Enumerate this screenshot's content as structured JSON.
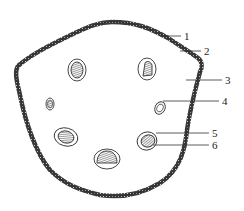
{
  "diagram": {
    "type": "cross-section",
    "colors": {
      "outline": "#2a2a2a",
      "background": "#ffffff",
      "hatch": "#3a3a3a"
    },
    "labels": [
      {
        "id": "1",
        "text": "1",
        "x": 185,
        "y": 39,
        "line": [
          160,
          36,
          181,
          36
        ]
      },
      {
        "id": "2",
        "text": "2",
        "x": 205,
        "y": 54,
        "line": [
          180,
          51,
          201,
          51
        ]
      },
      {
        "id": "3",
        "text": "3",
        "x": 226,
        "y": 84,
        "line": [
          186,
          80,
          222,
          80
        ]
      },
      {
        "id": "4",
        "text": "4",
        "x": 223,
        "y": 104,
        "line": [
          163,
          101,
          219,
          101
        ]
      },
      {
        "id": "5",
        "text": "5",
        "x": 213,
        "y": 137,
        "line": [
          156,
          133,
          209,
          133
        ]
      },
      {
        "id": "6",
        "text": "6",
        "x": 213,
        "y": 149,
        "line": [
          153,
          145,
          209,
          145
        ]
      }
    ],
    "bundles": [
      {
        "cx": 77,
        "cy": 70,
        "rx": 9,
        "ry": 11,
        "irx": 6,
        "iry": 8
      },
      {
        "cx": 147,
        "cy": 69,
        "rx": 9,
        "ry": 11,
        "irx": 6,
        "iry": 8
      },
      {
        "cx": 50,
        "cy": 104,
        "rx": 4,
        "ry": 6,
        "irx": 2.5,
        "iry": 4
      },
      {
        "cx": 160,
        "cy": 108,
        "rx": 5,
        "ry": 6,
        "irx": 3,
        "iry": 4
      },
      {
        "cx": 66,
        "cy": 137,
        "rx": 12,
        "ry": 9,
        "irx": 8,
        "iry": 6
      },
      {
        "cx": 147,
        "cy": 141,
        "rx": 10,
        "ry": 9,
        "irx": 7,
        "iry": 6
      },
      {
        "cx": 107,
        "cy": 159,
        "rx": 13,
        "ry": 10,
        "irx": 9,
        "iry": 6
      }
    ]
  }
}
